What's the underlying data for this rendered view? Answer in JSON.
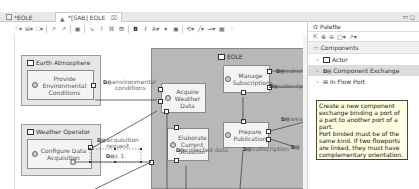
{
  "tabs": [
    {
      "label": "*EOLE",
      "active": false
    },
    {
      "label": "*[SAB] EOLE",
      "active": true,
      "close": "⌧"
    }
  ],
  "window_controls": "▭ ◻",
  "toolbar": {
    "items": [
      "⁘▾",
      "⊞▾",
      "⛶▾",
      "↗",
      "↗",
      "▣",
      "↘",
      "⌇",
      "⌘",
      "⛃",
      "B",
      "I",
      "A▾",
      "▾",
      "▣",
      "⟲▾",
      "╱▾",
      "→▾",
      "▦",
      "♡"
    ]
  },
  "diagram": {
    "actors": [
      {
        "name": "Earth Atmosphere",
        "function": "Provide Environmental Conditions"
      },
      {
        "name": "Weather Operator",
        "function": "Configure Data Acquisition"
      }
    ],
    "system": {
      "name": "EOLE",
      "functions": [
        "Acquire Weather Data",
        "Manage Subscriptions",
        "Elaborate Current Situation",
        "Prepare Publication"
      ]
    },
    "exchanges": [
      "environmental conditions",
      "acquisition request",
      "collected data",
      "subscription",
      "subscrip",
      "subscrip",
      "wea",
      "",
      "c 1"
    ],
    "exchange_icon": "D⊟"
  },
  "palette": {
    "title": "Palette",
    "tools": [
      "⇱",
      "⊕",
      "⊖",
      "▢▾",
      "↗▾"
    ],
    "drawer": "Components",
    "items": [
      {
        "label": "Actor",
        "icon": "actor-icon",
        "selected": false
      },
      {
        "label": "Component Exchange",
        "icon": "component-exchange-icon",
        "selected": true
      },
      {
        "label": "In Flow Port",
        "icon": "in-flow-port-icon",
        "selected": false
      },
      {
        "label": "System Function",
        "icon": "system-function-icon",
        "selected": false
      },
      {
        "label": "Functional Exchange",
        "icon": "functional-exchange-icon",
        "selected": false
      }
    ],
    "tooltip": "Create a new component exchange binding a port of a part to another port of a part.\nPort binded must be of the same kind. If two flowports are linked, they must have complementary orientation."
  }
}
